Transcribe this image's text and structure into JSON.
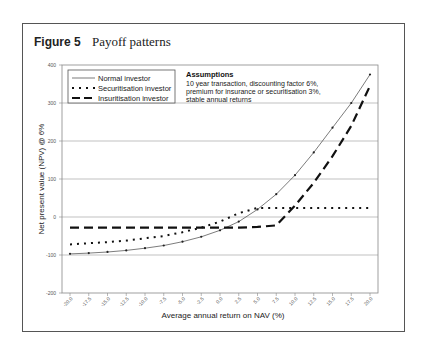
{
  "figure": {
    "number": "Figure 5",
    "title": "Payoff patterns"
  },
  "assumptions": {
    "title": "Assumptions",
    "lines": [
      "10 year transaction, discounting factor 6%,",
      "premium for insurance or securitisation 3%,",
      "stable annual returns"
    ]
  },
  "chart_data": {
    "type": "line",
    "title": "Payoff patterns",
    "xlabel": "Average annual return on NAV (%)",
    "ylabel": "Net present value (NPV) @ 6%",
    "xlim": [
      -20,
      20
    ],
    "ylim": [
      -200,
      400
    ],
    "grid": true,
    "legend_position": "upper-left",
    "x_tick_labels": [
      "-20.0",
      "-17.5",
      "-15.0",
      "-12.5",
      "-10.0",
      "-7.5",
      "-5.0",
      "-2.5",
      "0.0",
      "2.5",
      "5.0",
      "7.5",
      "10.0",
      "12.5",
      "15.0",
      "17.5",
      "20.0"
    ],
    "y_tick_labels": [
      "-200",
      "-100",
      "0",
      "100",
      "200",
      "300",
      "400"
    ],
    "x": [
      -20,
      -17.5,
      -15,
      -12.5,
      -10,
      -7.5,
      -5,
      -2.5,
      0,
      2.5,
      5,
      7.5,
      10,
      12.5,
      15,
      17.5,
      20
    ],
    "series": [
      {
        "name": "Normal investor",
        "style": "solid-thin",
        "values": [
          -97,
          -95,
          -92,
          -88,
          -82,
          -75,
          -65,
          -52,
          -35,
          -12,
          20,
          60,
          110,
          170,
          235,
          300,
          375
        ]
      },
      {
        "name": "Securitisation investor",
        "style": "dotted",
        "values": [
          -72,
          -69,
          -66,
          -62,
          -56,
          -50,
          -40,
          -28,
          -12,
          10,
          24,
          24,
          24,
          24,
          24,
          24,
          24
        ]
      },
      {
        "name": "Insuritisation investor",
        "style": "long-dash",
        "values": [
          -28,
          -28,
          -28,
          -28,
          -28,
          -28,
          -28,
          -28,
          -28,
          -28,
          -26,
          -22,
          30,
          90,
          160,
          240,
          345
        ]
      }
    ]
  }
}
